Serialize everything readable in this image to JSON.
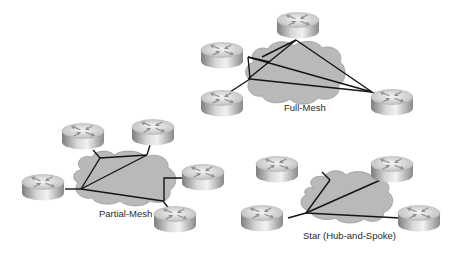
{
  "diagram": {
    "colors": {
      "background": "#ffffff",
      "cloud": "#b9b9b9",
      "link": "#141414",
      "router_top": "#e6e6e6",
      "router_side": "#9c9c9c"
    },
    "topologies": [
      {
        "id": "full-mesh",
        "label": "Full-Mesh",
        "routers": 4,
        "links": "every router connected to every other router"
      },
      {
        "id": "partial-mesh",
        "label": "Partial-Mesh",
        "routers": 5,
        "links": "some routers interconnected"
      },
      {
        "id": "star",
        "label": "Star (Hub-and-Spoke)",
        "routers": 4,
        "links": "all spokes connect to a single hub router"
      }
    ]
  }
}
